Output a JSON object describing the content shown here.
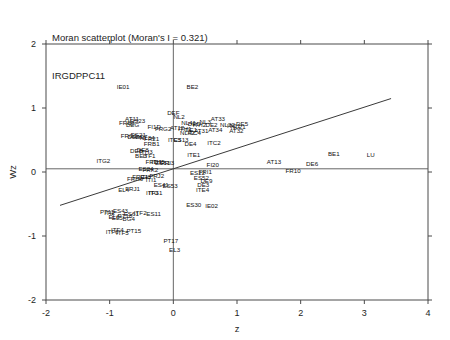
{
  "title": {
    "line1": "Moran scatterplot (Moran's I = 0.321)",
    "line2": "IRGDPPC11"
  },
  "chart_data": {
    "type": "scatter",
    "title": "Moran scatterplot (Moran's I = 0.321)",
    "subtitle": "IRGDPPC11",
    "xlabel": "z",
    "ylabel": "Wz",
    "xlim": [
      -2,
      4
    ],
    "ylim": [
      -2,
      2
    ],
    "xticks": [
      -2,
      -1,
      0,
      1,
      2,
      3,
      4
    ],
    "yticks": [
      -2,
      -1,
      0,
      1,
      2
    ],
    "xticklabels": [
      "-2",
      "-1",
      "0",
      "1",
      "2",
      "3",
      "4"
    ],
    "yticklabels": [
      "-2",
      "-1",
      "0",
      "1",
      "2"
    ],
    "grid": false,
    "legend": null,
    "morans_i": 0.321,
    "reference_lines": [
      {
        "name": "horizontal-mean-line",
        "type": "hline",
        "y": 0.05
      },
      {
        "name": "vertical-mean-line",
        "type": "vline",
        "x": 0.0
      }
    ],
    "fit_line": {
      "name": "moran-regression-line",
      "slope": 0.321,
      "intercept": 0.05,
      "x_start": -1.78,
      "x_end": 3.42
    },
    "points": [
      {
        "label": "IE01",
        "x": -0.79,
        "y": 1.33
      },
      {
        "label": "BE2",
        "x": 0.3,
        "y": 1.33
      },
      {
        "label": "DEF",
        "x": 0.0,
        "y": 0.93
      },
      {
        "label": "NL2",
        "x": 0.09,
        "y": 0.86
      },
      {
        "label": "AT11",
        "x": -0.65,
        "y": 0.83
      },
      {
        "label": "ES23",
        "x": -0.56,
        "y": 0.8
      },
      {
        "label": "FRB3",
        "x": -0.73,
        "y": 0.77
      },
      {
        "label": "DEG",
        "x": -0.64,
        "y": 0.73
      },
      {
        "label": "AT33",
        "x": 0.7,
        "y": 0.83
      },
      {
        "label": "NL3",
        "x": 0.5,
        "y": 0.79
      },
      {
        "label": "DE5",
        "x": 1.08,
        "y": 0.76
      },
      {
        "label": "NL41",
        "x": 0.24,
        "y": 0.77
      },
      {
        "label": "DED",
        "x": 0.33,
        "y": 0.76
      },
      {
        "label": "ITH2",
        "x": 0.41,
        "y": 0.74
      },
      {
        "label": "DE2",
        "x": 0.6,
        "y": 0.74
      },
      {
        "label": "NL22",
        "x": 0.85,
        "y": 0.73
      },
      {
        "label": "ITC1",
        "x": 0.95,
        "y": 0.72
      },
      {
        "label": "AT34",
        "x": 0.66,
        "y": 0.66
      },
      {
        "label": "AT32",
        "x": 0.99,
        "y": 0.64
      },
      {
        "label": "NL21",
        "x": 1.02,
        "y": 0.7
      },
      {
        "label": "FI1D",
        "x": -0.3,
        "y": 0.7
      },
      {
        "label": "FRG2",
        "x": -0.16,
        "y": 0.67
      },
      {
        "label": "AT12",
        "x": 0.06,
        "y": 0.69
      },
      {
        "label": "ITH1",
        "x": 0.18,
        "y": 0.68
      },
      {
        "label": "DE1",
        "x": 0.28,
        "y": 0.66
      },
      {
        "label": "AT31",
        "x": 0.44,
        "y": 0.64
      },
      {
        "label": "NL42",
        "x": 0.22,
        "y": 0.62
      },
      {
        "label": "ITC4",
        "x": 0.33,
        "y": 0.62
      },
      {
        "label": "ES21",
        "x": -0.55,
        "y": 0.58
      },
      {
        "label": "FRC1",
        "x": -0.7,
        "y": 0.56
      },
      {
        "label": "DEA",
        "x": -0.62,
        "y": 0.55
      },
      {
        "label": "DE7",
        "x": -0.5,
        "y": 0.55
      },
      {
        "label": "NL34",
        "x": -0.41,
        "y": 0.54
      },
      {
        "label": "FR21",
        "x": -0.34,
        "y": 0.52
      },
      {
        "label": "ITC3",
        "x": 0.02,
        "y": 0.5
      },
      {
        "label": "ES13",
        "x": 0.12,
        "y": 0.5
      },
      {
        "label": "ITC2",
        "x": 0.64,
        "y": 0.46
      },
      {
        "label": "DE4",
        "x": 0.27,
        "y": 0.44
      },
      {
        "label": "FRB1",
        "x": -0.34,
        "y": 0.44
      },
      {
        "label": "DEB",
        "x": -0.58,
        "y": 0.33
      },
      {
        "label": "DE8",
        "x": -0.48,
        "y": 0.34
      },
      {
        "label": "ITH3",
        "x": -0.43,
        "y": 0.32
      },
      {
        "label": "BE3",
        "x": -0.51,
        "y": 0.26
      },
      {
        "label": "ITF1",
        "x": -0.38,
        "y": 0.25
      },
      {
        "label": "ITE1",
        "x": 0.32,
        "y": 0.27
      },
      {
        "label": "ITG2",
        "x": -1.1,
        "y": 0.18
      },
      {
        "label": "FRD1",
        "x": -0.31,
        "y": 0.16
      },
      {
        "label": "ITH5",
        "x": -0.24,
        "y": 0.16
      },
      {
        "label": "ES51",
        "x": -0.17,
        "y": 0.14
      },
      {
        "label": "FRI3",
        "x": -0.09,
        "y": 0.14
      },
      {
        "label": "FI20",
        "x": 0.62,
        "y": 0.12
      },
      {
        "label": "AT13",
        "x": 1.58,
        "y": 0.16
      },
      {
        "label": "ES24",
        "x": -0.43,
        "y": 0.05
      },
      {
        "label": "FRK2",
        "x": -0.36,
        "y": 0.04
      },
      {
        "label": "DE6",
        "x": 2.18,
        "y": 0.13
      },
      {
        "label": "BE1",
        "x": 2.52,
        "y": 0.28
      },
      {
        "label": "LU",
        "x": 3.1,
        "y": 0.27
      },
      {
        "label": "FR10",
        "x": 1.88,
        "y": 0.02
      },
      {
        "label": "ES22",
        "x": 0.38,
        "y": -0.02
      },
      {
        "label": "FRI1",
        "x": 0.5,
        "y": 0.01
      },
      {
        "label": "ES52",
        "x": 0.44,
        "y": -0.09
      },
      {
        "label": "FRJ2",
        "x": -0.26,
        "y": -0.06
      },
      {
        "label": "FRE1",
        "x": -0.52,
        "y": -0.07
      },
      {
        "label": "ITI3",
        "x": -0.44,
        "y": -0.08
      },
      {
        "label": "FRH0",
        "x": -0.6,
        "y": -0.1
      },
      {
        "label": "ITI1",
        "x": -0.35,
        "y": -0.12
      },
      {
        "label": "ES41",
        "x": -0.19,
        "y": -0.2
      },
      {
        "label": "ES53",
        "x": -0.05,
        "y": -0.22
      },
      {
        "label": "DE3",
        "x": 0.47,
        "y": -0.2
      },
      {
        "label": "DE9",
        "x": 0.52,
        "y": -0.13
      },
      {
        "label": "ITE4",
        "x": 0.46,
        "y": -0.28
      },
      {
        "label": "EL4",
        "x": -0.78,
        "y": -0.28
      },
      {
        "label": "FRJ1",
        "x": -0.64,
        "y": -0.26
      },
      {
        "label": "ITF3",
        "x": -0.33,
        "y": -0.32
      },
      {
        "label": "ITG1",
        "x": -0.28,
        "y": -0.33
      },
      {
        "label": "ES43",
        "x": -0.83,
        "y": -0.6
      },
      {
        "label": "PT11",
        "x": -1.04,
        "y": -0.62
      },
      {
        "label": "ITI2",
        "x": -1.0,
        "y": -0.64
      },
      {
        "label": "ES61",
        "x": -0.66,
        "y": -0.66
      },
      {
        "label": "ITF2",
        "x": -0.52,
        "y": -0.63
      },
      {
        "label": "ES11",
        "x": -0.31,
        "y": -0.66
      },
      {
        "label": "EL6",
        "x": -0.93,
        "y": -0.7
      },
      {
        "label": "PT18",
        "x": -0.76,
        "y": -0.69
      },
      {
        "label": "EL5",
        "x": -0.88,
        "y": -0.72
      },
      {
        "label": "BG4",
        "x": -0.7,
        "y": -0.73
      },
      {
        "label": "ITF4",
        "x": -0.88,
        "y": -0.9
      },
      {
        "label": "ITF6",
        "x": -0.96,
        "y": -0.94
      },
      {
        "label": "ITF5",
        "x": -0.8,
        "y": -0.95
      },
      {
        "label": "PT15",
        "x": -0.62,
        "y": -0.92
      },
      {
        "label": "ES30",
        "x": 0.32,
        "y": -0.51
      },
      {
        "label": "IE02",
        "x": 0.6,
        "y": -0.53
      },
      {
        "label": "PT17",
        "x": -0.04,
        "y": -1.08
      },
      {
        "label": "EL3",
        "x": 0.02,
        "y": -1.22
      }
    ]
  }
}
